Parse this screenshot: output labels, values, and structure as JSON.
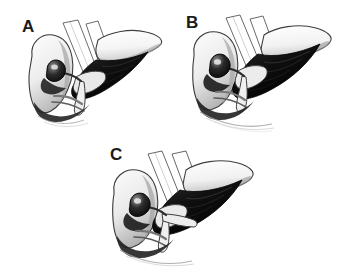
{
  "figure": {
    "background_color": "#ffffff",
    "ink_color": "#1b1b1b",
    "shadow_color": "#111111",
    "midtone_color": "#9a9a9a",
    "highlight_color": "#f2f2f2",
    "panel_count": 3
  },
  "panels": [
    {
      "id": "a",
      "label": "A",
      "position": "top-left",
      "structures": [
        "liver-right-lobe",
        "liver-left-lobe",
        "gallbladder",
        "cystic-duct",
        "common-bile-duct",
        "hepatic-artery",
        "portal-vein",
        "falciform-ligament"
      ]
    },
    {
      "id": "b",
      "label": "B",
      "position": "top-right",
      "structures": [
        "liver-right-lobe",
        "liver-left-lobe",
        "gallbladder",
        "cystic-duct",
        "common-bile-duct",
        "hepatic-artery",
        "portal-vein",
        "falciform-ligament"
      ]
    },
    {
      "id": "c",
      "label": "C",
      "position": "bottom-center",
      "structures": [
        "liver-right-lobe",
        "liver-left-lobe",
        "gallbladder",
        "cystic-duct",
        "common-bile-duct",
        "hepatic-artery",
        "portal-vein",
        "falciform-ligament"
      ]
    }
  ]
}
